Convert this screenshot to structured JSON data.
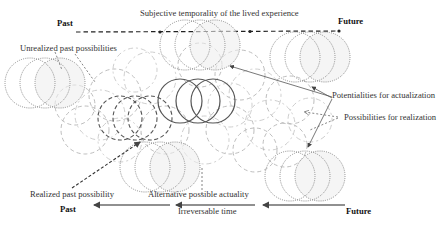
{
  "top_axis": {
    "title": "Subjective temporality of the lived experience",
    "left_label": "Past",
    "right_label": "Future",
    "line_style": "dashed"
  },
  "bottom_axis": {
    "title": "Irreversable time",
    "left_label": "Past",
    "right_label": "Future",
    "line_style": "solid-arrows-pointing-past"
  },
  "annotations": {
    "unrealized": "Unrealized past possibilities",
    "potentialities": "Potentialities for actualization",
    "possibilities": "Possibilities for realization",
    "realized": "Realized past possibility",
    "alternative": "Alternative possible actuality"
  },
  "colors": {
    "dotted_circles": "#8a8a8a",
    "background_dashes": "#b5b5b5",
    "solid_circles": "#555555",
    "text": "#333333"
  },
  "circle_groups": [
    {
      "name": "unrealized-past-group",
      "style": "dotted",
      "cx": [
        30,
        45,
        60
      ],
      "cy": 83,
      "r": 25
    },
    {
      "name": "top-center-group",
      "style": "dotted",
      "cx": [
        185,
        200,
        215
      ],
      "cy": 45,
      "r": 25
    },
    {
      "name": "top-right-group",
      "style": "dotted",
      "cx": [
        295,
        310,
        325
      ],
      "cy": 57,
      "r": 25
    },
    {
      "name": "actual-present-group",
      "style": "solid",
      "cx": [
        180,
        198,
        213
      ],
      "cy": 101,
      "r": 22
    },
    {
      "name": "realized-past-group",
      "style": "dark-dashed",
      "cx": [
        120,
        135,
        150
      ],
      "cy": 118,
      "r": 22
    },
    {
      "name": "bottom-center-group",
      "style": "dotted",
      "cx": [
        145,
        160,
        175
      ],
      "cy": 167,
      "r": 25
    },
    {
      "name": "bottom-right-group",
      "style": "dotted",
      "cx": [
        290,
        305,
        320
      ],
      "cy": 176,
      "r": 25
    }
  ]
}
